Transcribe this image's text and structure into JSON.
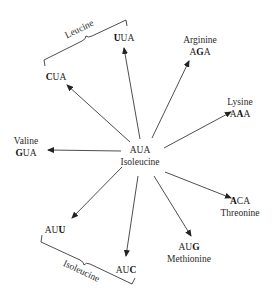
{
  "center": {
    "codon": "AUA",
    "amino_acid": "Isoleucine"
  },
  "mutations": [
    {
      "id": "uua",
      "codon_parts": [
        "",
        "U",
        "UA"
      ],
      "amino_acid": ""
    },
    {
      "id": "cua",
      "codon_parts": [
        "",
        "C",
        "UA"
      ],
      "amino_acid": ""
    },
    {
      "id": "aga",
      "codon_parts": [
        "A",
        "G",
        "A"
      ],
      "amino_acid": "Arginine"
    },
    {
      "id": "aaa",
      "codon_parts": [
        "A",
        "A",
        "A"
      ],
      "amino_acid": "Lysine"
    },
    {
      "id": "gua",
      "codon_parts": [
        "",
        "G",
        "UA"
      ],
      "amino_acid": "Valine"
    },
    {
      "id": "aca",
      "codon_parts": [
        "",
        "A",
        "CA"
      ],
      "amino_acid": "Threonine"
    },
    {
      "id": "aug",
      "codon_parts": [
        "AU",
        "G",
        ""
      ],
      "amino_acid": "Methionine"
    },
    {
      "id": "auu",
      "codon_parts": [
        "AU",
        "U",
        ""
      ],
      "amino_acid": ""
    },
    {
      "id": "auc",
      "codon_parts": [
        "AU",
        "C",
        ""
      ],
      "amino_acid": ""
    }
  ],
  "groups": {
    "leucine": "Leucine",
    "isoleucine": "Isoleucine"
  },
  "colors": {
    "line": "#3a3a3a",
    "text": "#2a2a2a"
  }
}
